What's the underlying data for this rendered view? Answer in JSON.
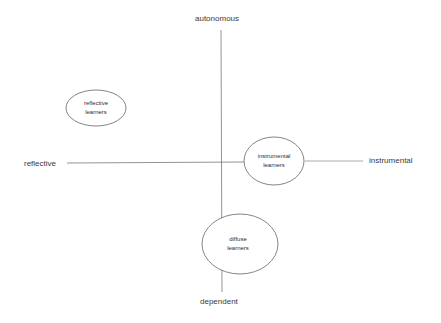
{
  "diagram": {
    "type": "quadrant",
    "axes": {
      "vertical": {
        "top": "autonomous",
        "bottom": "dependent"
      },
      "horizontal": {
        "left": "reflective",
        "right": "instrumental"
      }
    },
    "nodes": [
      {
        "id": "reflective",
        "line1": "reflective",
        "line2": "learners",
        "cx": 96,
        "cy": 108,
        "rx": 30,
        "ry": 18
      },
      {
        "id": "instrumental",
        "line1": "instrumental",
        "line2": "learners",
        "cx": 274,
        "cy": 161,
        "rx": 30,
        "ry": 24
      },
      {
        "id": "diffuse",
        "line1": "diffuse",
        "line2": "learners",
        "cx": 240,
        "cy": 244,
        "rx": 38,
        "ry": 30
      }
    ],
    "colors": {
      "line": "#555555",
      "ellipse": "#555555",
      "text": "#333333"
    }
  }
}
